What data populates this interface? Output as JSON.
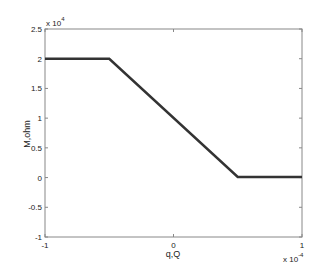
{
  "chart_data": {
    "type": "line",
    "title": "",
    "xlabel": "q,Q",
    "ylabel": "M,ohm",
    "x_multiplier": "x 10",
    "x_multiplier_exp": "-4",
    "y_multiplier": "x 10",
    "y_multiplier_exp": "4",
    "xlim": [
      -1,
      1
    ],
    "ylim": [
      -1,
      2.5
    ],
    "xticks": [
      "-1",
      "0",
      "1"
    ],
    "yticks": [
      "-1",
      "-0.5",
      "0",
      "0.5",
      "1",
      "1.5",
      "2",
      "2.5"
    ],
    "grid": false,
    "series": [
      {
        "name": "M(q)",
        "color": "#333333",
        "x": [
          -1,
          -0.5,
          0.5,
          1
        ],
        "y": [
          2,
          2,
          0.01,
          0.01
        ]
      }
    ]
  }
}
